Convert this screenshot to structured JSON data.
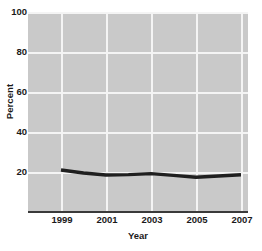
{
  "chart_data": {
    "type": "line",
    "title": "",
    "xlabel": "Year",
    "ylabel": "Percent",
    "x": [
      1999,
      2000,
      2001,
      2002,
      2003,
      2004,
      2005,
      2006,
      2007
    ],
    "series": [
      {
        "name": "Percent",
        "values": [
          21.0,
          19.5,
          18.5,
          18.7,
          19.2,
          18.3,
          17.4,
          18.0,
          18.6
        ]
      }
    ],
    "xlim": [
      1998.5,
      2007.5
    ],
    "ylim": [
      0,
      104
    ],
    "ytick_labels": [
      "100",
      "80",
      "60",
      "40",
      "20"
    ],
    "ytick_values": [
      100,
      80,
      60,
      40,
      20
    ],
    "xtick_labels": [
      "1999",
      "2001",
      "2003",
      "2005",
      "2007"
    ],
    "xtick_values": [
      1999,
      2001,
      2003,
      2005,
      2007
    ],
    "grid": true,
    "grid_color": "#f4f4f4",
    "plot_background": "#c9c9c9",
    "line_color": "#1f1f1f",
    "line_width": 3,
    "legend": null,
    "legend_position": "none",
    "annotations": []
  }
}
